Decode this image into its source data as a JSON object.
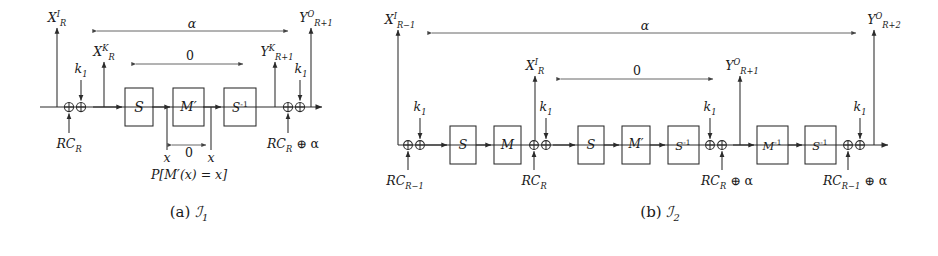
{
  "figure": {
    "type": "cryptanalysis-round-characteristic-diagram",
    "panels": [
      {
        "id": "a",
        "caption": "(a) ℱ₁",
        "caption_prefix": "(a)",
        "caption_symbol": "ℱ1",
        "boxes": [
          "S",
          "M′",
          "S⁻¹"
        ],
        "xor_inputs_left": [
          "RC_R",
          "k₁"
        ],
        "xor_inputs_right": [
          "RC_R ⊕ α",
          "k₁"
        ],
        "top_labels": {
          "left_outer": "X^I_R",
          "left_inner": "X^K_R",
          "right_inner": "Y^K_{R+1}",
          "right_outer": "Y^O_{R+1}"
        },
        "difference_arrows": [
          {
            "label": "α",
            "from": "X^I_R",
            "to": "Y^O_{R+1}"
          },
          {
            "label": "0",
            "from": "X^K_R",
            "to": "Y^K_{R+1}"
          },
          {
            "label": "0",
            "from": "x",
            "to": "x"
          }
        ],
        "sub_annotations": {
          "left_tap": "x",
          "right_tap": "x",
          "probability": "P[M′(x) = x]"
        }
      },
      {
        "id": "b",
        "caption": "(b) ℱ₂",
        "caption_prefix": "(b)",
        "caption_symbol": "ℱ2",
        "boxes": [
          "S",
          "M",
          "S",
          "M′",
          "S⁻¹",
          "M⁻¹",
          "S⁻¹"
        ],
        "xor_inputs_1": [
          "RC_{R-1}",
          "k₁"
        ],
        "xor_inputs_2": [
          "RC_R",
          "k₁"
        ],
        "xor_inputs_3": [
          "RC_R ⊕ α",
          "k₁"
        ],
        "xor_inputs_4": [
          "RC_{R-1} ⊕ α",
          "k₁"
        ],
        "top_labels": {
          "left_outer": "X^I_{R-1}",
          "left_inner": "X^I_R",
          "right_inner": "Y^O_{R+1}",
          "right_outer": "Y^O_{R+2}"
        },
        "difference_arrows": [
          {
            "label": "α",
            "from": "X^I_{R-1}",
            "to": "Y^O_{R+2}"
          },
          {
            "label": "0",
            "from": "X^I_R",
            "to": "Y^O_{R+1}"
          }
        ]
      }
    ]
  },
  "panel_a": {
    "label_XIR": {
      "base": "X",
      "sup": "I",
      "sub": "R"
    },
    "label_XKR": {
      "base": "X",
      "sup": "K",
      "sub": "R"
    },
    "label_YKR1": {
      "base": "Y",
      "sup": "K",
      "sub": "R+1"
    },
    "label_YOR1": {
      "base": "Y",
      "sup": "O",
      "sub": "R+1"
    },
    "alpha": "α",
    "zero_top": "0",
    "zero_bottom": "0",
    "k1_left": {
      "base": "k",
      "sub": "1"
    },
    "k1_right": {
      "base": "k",
      "sub": "1"
    },
    "rc_left": {
      "base": "RC",
      "sub": "R"
    },
    "rc_right": {
      "base": "RC",
      "sub": "R",
      "tail": " ⊕ α"
    },
    "box_S": "S",
    "box_Mp": "M′",
    "box_Sinv": {
      "base": "S",
      "sup": "-1"
    },
    "tap_left": "x",
    "tap_right": "x",
    "probability": "P[M′(x) = x]",
    "caption_prefix": "(a)",
    "caption_symbol": {
      "base": "ℐ",
      "sub": "1"
    }
  },
  "panel_b": {
    "label_XIRm1": {
      "base": "X",
      "sup": "I",
      "sub": "R−1"
    },
    "label_XIR": {
      "base": "X",
      "sup": "I",
      "sub": "R"
    },
    "label_YOR1": {
      "base": "Y",
      "sup": "O",
      "sub": "R+1"
    },
    "label_YOR2": {
      "base": "Y",
      "sup": "O",
      "sub": "R+2"
    },
    "alpha": "α",
    "zero": "0",
    "k1_1": {
      "base": "k",
      "sub": "1"
    },
    "k1_2": {
      "base": "k",
      "sub": "1"
    },
    "k1_3": {
      "base": "k",
      "sub": "1"
    },
    "k1_4": {
      "base": "k",
      "sub": "1"
    },
    "rc_1": {
      "base": "RC",
      "sub": "R−1"
    },
    "rc_2": {
      "base": "RC",
      "sub": "R"
    },
    "rc_3": {
      "base": "RC",
      "sub": "R",
      "tail": " ⊕ α"
    },
    "rc_4": {
      "base": "RC",
      "sub": "R−1",
      "tail": " ⊕ α"
    },
    "box_S1": "S",
    "box_M": "M",
    "box_S2": "S",
    "box_Mp": "M′",
    "box_Sinv1": {
      "base": "S",
      "sup": "-1"
    },
    "box_Minv": {
      "base": "M",
      "sup": "-1"
    },
    "box_Sinv2": {
      "base": "S",
      "sup": "-1"
    },
    "caption_prefix": "(b)",
    "caption_symbol": {
      "base": "ℐ",
      "sub": "2"
    }
  },
  "colors": {
    "background": "#ffffff",
    "ink": "#1a1a1a",
    "line": "#2b2b2b"
  }
}
